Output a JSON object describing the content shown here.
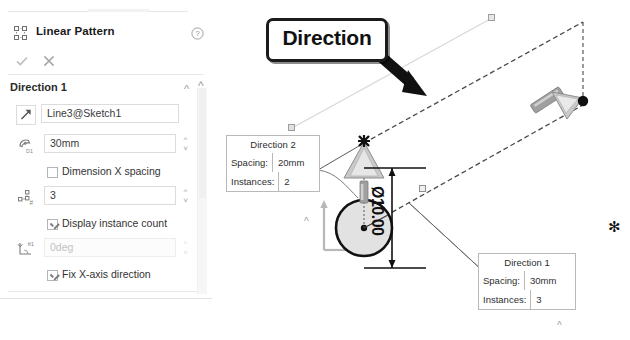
{
  "panel": {
    "title": "Linear Pattern",
    "title_icon": "linear-pattern-icon",
    "help_icon": "help-icon",
    "accept_icon": "check-icon",
    "cancel_icon": "close-icon",
    "section": {
      "label": "Direction 1",
      "collapse_icon": "chevron-up-icon"
    },
    "fields": {
      "direction_ref": {
        "icon": "direction-arrow-icon",
        "value": "Line3@Sketch1",
        "placeholder": "Select a direction reference"
      },
      "spacing": {
        "icon": "spacing-d1-icon",
        "value": "30mm",
        "placeholder": "Spacing"
      },
      "dimension_x_spacing": {
        "label": "Dimension X spacing",
        "checked": false
      },
      "instances": {
        "icon": "instance-count-icon",
        "value": "3",
        "placeholder": "Number of instances"
      },
      "display_instance_count": {
        "label": "Display instance count",
        "checked": true
      },
      "angle": {
        "icon": "angle-theta1-icon",
        "value": "0deg",
        "disabled": true
      },
      "fix_x_axis": {
        "label": "Fix X-axis direction",
        "checked": true
      }
    }
  },
  "graphics": {
    "callout": {
      "label": "Direction",
      "arrow_icon": "bold-arrow-icon"
    },
    "panel_arrow_icon": "bold-arrow-icon",
    "diameter_dimension": "Ø10.00",
    "direction2_box": {
      "title": "Direction 2",
      "spacing_label": "Spacing:",
      "spacing_value": "20mm",
      "instances_label": "Instances:",
      "instances_value": "2",
      "collapse_icon": "chevron-up-icon"
    },
    "direction1_box": {
      "title": "Direction 1",
      "spacing_label": "Spacing:",
      "spacing_value": "30mm",
      "instances_label": "Instances:",
      "instances_value": "3",
      "collapse_icon": "chevron-up-icon"
    },
    "origin_triad_icon": "origin-triad-icon",
    "drag_handle_vertical_icon": "drag-arrow-up-icon",
    "drag_handle_diagonal_icon": "drag-arrow-diagonal-icon",
    "asterisk_marker": "✻"
  },
  "colors": {
    "panel_bg": "#ffffff",
    "border": "#dcdcdc",
    "text": "#333333",
    "disabled_text": "#c2c2c2",
    "manipulator_gray": "#9a9a9a",
    "callout_black": "#1b1b1b"
  }
}
